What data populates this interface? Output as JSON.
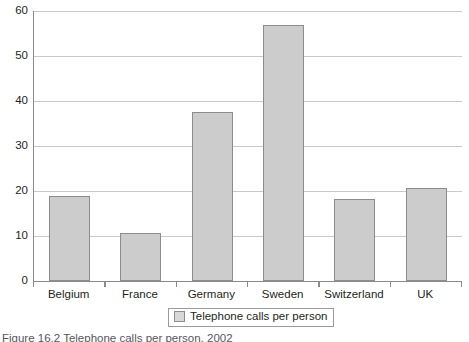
{
  "chart_data": {
    "type": "bar",
    "title": "",
    "xlabel": "",
    "ylabel": "",
    "categories": [
      "Belgium",
      "France",
      "Germany",
      "Sweden",
      "Switzerland",
      "UK"
    ],
    "values": [
      19,
      10.7,
      37.6,
      56.9,
      18.2,
      20.7
    ],
    "series": [
      {
        "name": "Telephone calls per person",
        "values": [
          19,
          10.7,
          37.6,
          56.9,
          18.2,
          20.7
        ]
      }
    ],
    "ylim": [
      0,
      60
    ],
    "yticks": [
      0,
      10,
      20,
      30,
      40,
      50,
      60
    ],
    "ytick_labels": [
      "0",
      "10",
      "20",
      "30",
      "40",
      "50",
      "60"
    ],
    "grid": true,
    "legend_position": "bottom-center",
    "bar_color": "#cccccc",
    "bar_border_color": "#8c8c8c",
    "grid_color": "#c9c9c9",
    "axis_color": "#8a8a8a"
  },
  "legend": {
    "swatch_name": "legend-swatch",
    "label": "Telephone calls per person"
  },
  "caption": {
    "text": "Figure 16.2  Telephone calls per person, 2002"
  }
}
